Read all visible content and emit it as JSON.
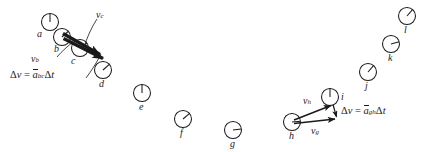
{
  "figure": {
    "type": "physics-motion-diagram",
    "background_color": "#ffffff",
    "ink_color": "#1a1a1a",
    "width": 429,
    "height": 152
  },
  "clocks": [
    {
      "id": "a",
      "label": "a",
      "cx": 50,
      "cy": 22,
      "r": 8.5,
      "hand_deg": 0,
      "label_x": 37,
      "label_y": 35
    },
    {
      "id": "b",
      "label": "b",
      "cx": 62,
      "cy": 37,
      "r": 8.5,
      "hand_deg": 48,
      "label_x": 54,
      "label_y": 50
    },
    {
      "id": "c",
      "label": "c",
      "cx": 80,
      "cy": 48,
      "r": 8.5,
      "hand_deg": 55,
      "label_x": 70,
      "label_y": 62
    },
    {
      "id": "d",
      "label": "d",
      "cx": 103,
      "cy": 70,
      "r": 8.5,
      "hand_deg": 48,
      "label_x": 97,
      "label_y": 86
    },
    {
      "id": "e",
      "label": "e",
      "cx": 142,
      "cy": 93,
      "r": 8.5,
      "hand_deg": 0,
      "label_x": 137,
      "label_y": 109
    },
    {
      "id": "f",
      "label": "f",
      "cx": 183,
      "cy": 119,
      "r": 8.5,
      "hand_deg": 50,
      "label_x": 179,
      "label_y": 135
    },
    {
      "id": "g",
      "label": "g",
      "cx": 233,
      "cy": 130,
      "r": 8.5,
      "hand_deg": 82,
      "label_x": 229,
      "label_y": 146
    },
    {
      "id": "h",
      "label": "h",
      "cx": 292,
      "cy": 122,
      "r": 8.5,
      "hand_deg": 95,
      "label_x": 288,
      "label_y": 139
    },
    {
      "id": "i",
      "label": "i",
      "cx": 330,
      "cy": 97,
      "r": 8.5,
      "hand_deg": 0,
      "label_x": 342,
      "label_y": 101
    },
    {
      "id": "j",
      "label": "j",
      "cx": 368,
      "cy": 72,
      "r": 8.5,
      "hand_deg": 40,
      "label_x": 364,
      "label_y": 88
    },
    {
      "id": "k",
      "label": "k",
      "cx": 391,
      "cy": 44,
      "r": 8.5,
      "hand_deg": 75,
      "label_x": 388,
      "label_y": 60
    },
    {
      "id": "l",
      "label": "l",
      "cx": 407,
      "cy": 16,
      "r": 8.5,
      "hand_deg": 40,
      "label_x": 404,
      "label_y": 33
    }
  ],
  "vectors": [
    {
      "name": "v_b_arrow",
      "x1": 63,
      "y1": 33,
      "x2": 104,
      "y2": 56,
      "style": "thick"
    },
    {
      "name": "v_c_arrow",
      "x1": 63,
      "y1": 37,
      "x2": 107,
      "y2": 60,
      "style": "thick"
    },
    {
      "name": "v_h_arrow",
      "x1": 293,
      "y1": 121,
      "x2": 333,
      "y2": 105,
      "style": "thin"
    },
    {
      "name": "v_g_arrow",
      "x1": 293,
      "y1": 124,
      "x2": 337,
      "y2": 119,
      "style": "thin"
    },
    {
      "name": "delta_v_gh",
      "x1": 333,
      "y1": 104,
      "x2": 337,
      "y2": 118,
      "style": "thin"
    }
  ],
  "leaders": [
    {
      "name": "leader-vb",
      "x1": 58,
      "y1": 59,
      "x2": 72,
      "y2": 44
    },
    {
      "name": "leader-vc",
      "x1": 96,
      "y1": 28,
      "x2": 84,
      "y2": 48
    },
    {
      "name": "leader-deltav-bc",
      "x1": 86,
      "y1": 80,
      "x2": 99,
      "y2": 55
    }
  ],
  "labels": {
    "v_b": {
      "base": "v",
      "sub": "b",
      "x": 31,
      "y": 52
    },
    "v_c": {
      "base": "v",
      "sub": "c",
      "x": 96,
      "y": 8
    },
    "v_h": {
      "base": "v",
      "sub": "h",
      "x": 302,
      "y": 94
    },
    "v_g": {
      "base": "v",
      "sub": "g",
      "x": 310,
      "y": 126
    }
  },
  "equations": {
    "left": {
      "name": "delta-v-bc-equation",
      "delta": "Δ",
      "v": "v",
      "equals": "=",
      "a": "a",
      "a_sub": "bc",
      "delta2": "Δ",
      "t": "t",
      "x": 10,
      "y": 70,
      "plain": "Δv = ā_bc Δt"
    },
    "right": {
      "name": "delta-v-gh-equation",
      "delta": "Δ",
      "v": "v",
      "equals": "=",
      "a": "a",
      "a_sub": "gh",
      "delta2": "Δ",
      "t": "t",
      "x": 341,
      "y": 110,
      "plain": "Δv = ā_gh Δt"
    }
  }
}
